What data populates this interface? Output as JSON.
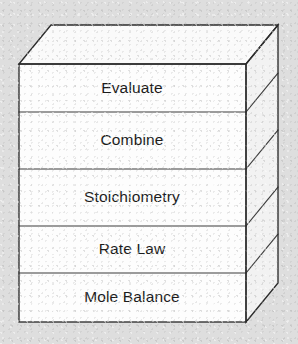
{
  "diagram": {
    "name": "algorithm-block-stack",
    "type": "isometric-stacked-blocks",
    "background_color": "#dedede",
    "face_fill_front": "#fdfdfd",
    "face_fill_top": "#fafafa",
    "face_fill_side": "#f2f2f2",
    "edge_color": "#2b2b2b",
    "text_color": "#1c1c1c",
    "depth_offset_x": 32,
    "depth_offset_y": -39,
    "front_left_x": 19,
    "front_right_x": 246,
    "front_top_y": 64,
    "front_bottom_y": 322,
    "layers": [
      {
        "id": "layer-evaluate",
        "label": "Evaluate",
        "top": 64,
        "bottom": 112,
        "order": 1
      },
      {
        "id": "layer-combine",
        "label": "Combine",
        "top": 112,
        "bottom": 169,
        "order": 2
      },
      {
        "id": "layer-stoichiometry",
        "label": "Stoichiometry",
        "top": 169,
        "bottom": 226,
        "order": 3
      },
      {
        "id": "layer-rate-law",
        "label": "Rate Law",
        "top": 226,
        "bottom": 273,
        "order": 4
      },
      {
        "id": "layer-mole-balance",
        "label": "Mole Balance",
        "top": 273,
        "bottom": 322,
        "order": 5
      }
    ]
  }
}
